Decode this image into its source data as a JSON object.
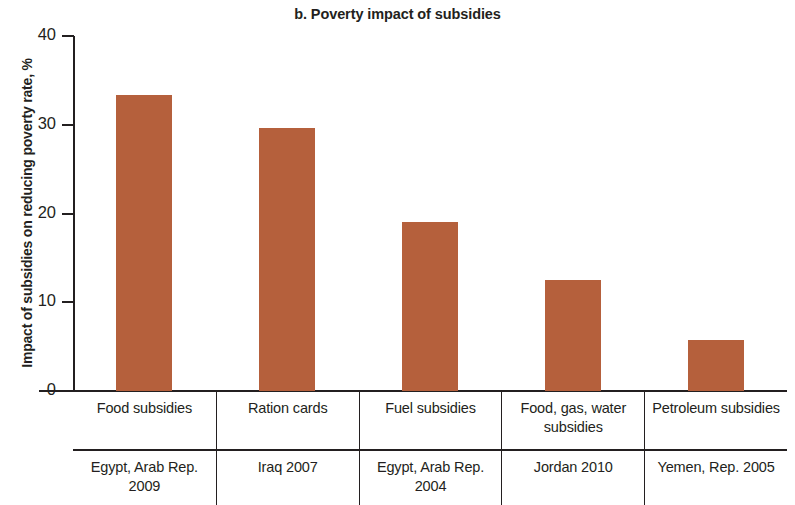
{
  "chart_data": {
    "type": "bar",
    "title": "b. Poverty impact of subsidies",
    "xlabel": "",
    "ylabel": "Impact of subsidies on reducing poverty rate, %",
    "ylim": [
      0,
      40
    ],
    "yticks": [
      0,
      10,
      20,
      30,
      40
    ],
    "ytick_labels": [
      "0",
      "10",
      "20",
      "30",
      "40"
    ],
    "grid": false,
    "legend": null,
    "bar_color": "#b5603c",
    "categories": [
      "Food subsidies",
      "Ration cards",
      "Fuel subsidies",
      "Food, gas, water subsidies",
      "Petroleum subsidies"
    ],
    "values": [
      33.4,
      29.6,
      19.0,
      12.5,
      5.7
    ],
    "sources": [
      "Egypt, Arab Rep. 2009",
      "Iraq 2007",
      "Egypt, Arab Rep. 2004",
      "Jordan 2010",
      "Yemen, Rep. 2005"
    ]
  },
  "axis": {
    "y_label": "Impact of subsidies on reducing poverty rate, %"
  }
}
